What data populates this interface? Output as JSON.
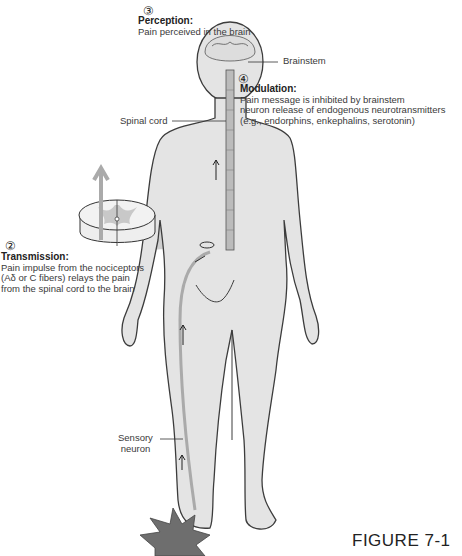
{
  "figure": {
    "caption": "FIGURE 7-1",
    "steps": [
      {
        "number": "②",
        "title": "Transmission:",
        "lines": [
          "Pain impulse from the nociceptors",
          "(Aδ or C fibers) relays the pain",
          "from the spinal cord to the brain"
        ]
      },
      {
        "number": "③",
        "title": "Perception:",
        "lines": [
          "Pain perceived in the brain"
        ]
      },
      {
        "number": "④",
        "title": "Modulation:",
        "lines": [
          "Pain message is inhibited by brainstem",
          "neuron release of endogenous neurotransmitters",
          "(e.g., endorphins, enkephalins, serotonin)"
        ]
      }
    ],
    "labels": {
      "brainstem": "Brainstem",
      "spinal_cord": "Spinal cord",
      "sensory_neuron_1": "Sensory",
      "sensory_neuron_2": "neuron"
    },
    "colors": {
      "body_fill": "#e4e4e4",
      "outline": "#3c3c3c",
      "star": "#6e6e6e",
      "cord_gray": "#b8b8b8",
      "shadow": "#cfcfcf"
    }
  }
}
